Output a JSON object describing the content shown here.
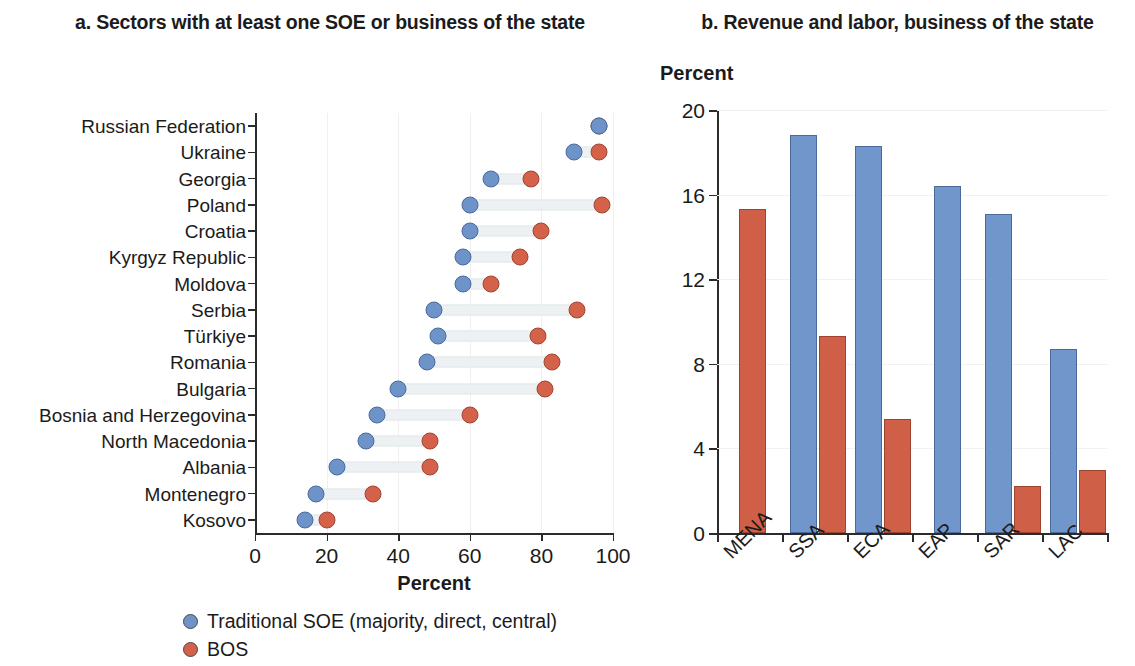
{
  "panel_a": {
    "title": "a. Sectors with at least one SOE or business of the state",
    "axis_title": "Percent",
    "legend": [
      {
        "label": "Traditional SOE (majority, direct, central)",
        "color": "#6e93c9",
        "marker": "circle"
      },
      {
        "label": "BOS",
        "color": "#d4624a",
        "marker": "circle"
      }
    ]
  },
  "panel_b": {
    "title": "b. Revenue and labor, business of the state",
    "axis_label": "Percent",
    "legend": [
      {
        "label": "BOS revenue as share of GDP",
        "color": "#7096cc",
        "marker": "square"
      },
      {
        "label": "BOS labor as share of formal employment",
        "color": "#cf5f47",
        "marker": "square"
      }
    ]
  },
  "chart_data": [
    {
      "type": "bar",
      "orientation": "horizontal-dumbbell",
      "title": "a. Sectors with at least one SOE or business of the state",
      "xlabel": "Percent",
      "ylabel": "",
      "xlim": [
        0,
        100
      ],
      "xticks": [
        0,
        20,
        40,
        60,
        80,
        100
      ],
      "grid": true,
      "legend_position": "bottom",
      "categories": [
        "Russian Federation",
        "Ukraine",
        "Georgia",
        "Poland",
        "Croatia",
        "Kyrgyz Republic",
        "Moldova",
        "Serbia",
        "Türkiye",
        "Romania",
        "Bulgaria",
        "Bosnia and Herzegovina",
        "North Macedonia",
        "Albania",
        "Montenegro",
        "Kosovo"
      ],
      "series": [
        {
          "name": "Traditional SOE (majority, direct, central)",
          "color": "#6e93c9",
          "values": [
            96,
            89,
            66,
            60,
            60,
            58,
            58,
            50,
            51,
            48,
            40,
            34,
            31,
            23,
            17,
            14
          ]
        },
        {
          "name": "BOS",
          "color": "#d4624a",
          "values": [
            96,
            96,
            77,
            97,
            80,
            74,
            66,
            90,
            79,
            83,
            81,
            60,
            49,
            49,
            33,
            20
          ]
        }
      ]
    },
    {
      "type": "bar",
      "orientation": "vertical-grouped",
      "title": "b. Revenue and labor, business of the state",
      "xlabel": "",
      "ylabel": "Percent",
      "ylim": [
        0,
        20
      ],
      "yticks": [
        0,
        4,
        8,
        12,
        16,
        20
      ],
      "grid": true,
      "legend_position": "bottom",
      "categories": [
        "MENA",
        "SSA",
        "ECA",
        "EAP",
        "SAR",
        "LAC"
      ],
      "series": [
        {
          "name": "BOS revenue as share of GDP",
          "color": "#7096cc",
          "values": [
            null,
            18.8,
            18.3,
            16.4,
            15.1,
            8.7
          ]
        },
        {
          "name": "BOS labor as share of formal employment",
          "color": "#cf5f47",
          "values": [
            15.3,
            9.3,
            5.4,
            null,
            2.2,
            3.0
          ]
        }
      ]
    }
  ]
}
